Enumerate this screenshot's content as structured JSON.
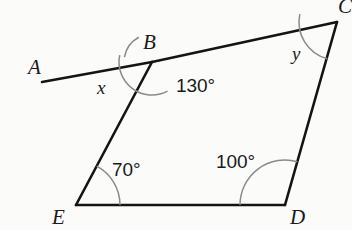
{
  "figure": {
    "background_color": "#fbfbfa",
    "stroke_color": "#141414",
    "arc_color": "#8a8a8a",
    "label_color": "#1a1a1a"
  },
  "vertices": [
    {
      "id": "A",
      "label": "A",
      "x": 42,
      "y": 82,
      "label_x": 28,
      "label_y": 57,
      "type": "ray-endpoint"
    },
    {
      "id": "B",
      "label": "B",
      "x": 152,
      "y": 62,
      "label_x": 143,
      "label_y": 32,
      "type": "vertex"
    },
    {
      "id": "C",
      "label": "C",
      "x": 337,
      "y": 22,
      "label_x": 338,
      "label_y": -4,
      "type": "vertex"
    },
    {
      "id": "D",
      "label": "D",
      "x": 285,
      "y": 205,
      "label_x": 290,
      "label_y": 207,
      "type": "vertex"
    },
    {
      "id": "E",
      "label": "E",
      "x": 76,
      "y": 205,
      "label_x": 52,
      "label_y": 207,
      "type": "vertex"
    }
  ],
  "segments": [
    {
      "name": "ray-A-to-B",
      "from": "A",
      "to": "B"
    },
    {
      "name": "segment-B-to-C",
      "from": "B",
      "to": "C"
    },
    {
      "name": "segment-C-to-D",
      "from": "C",
      "to": "D"
    },
    {
      "name": "segment-D-to-E",
      "from": "D",
      "to": "E"
    },
    {
      "name": "segment-E-to-B",
      "from": "E",
      "to": "B"
    }
  ],
  "angles": [
    {
      "id": "x",
      "at_vertex": "B",
      "label": "x",
      "label_kind": "variable",
      "known": false,
      "label_x": 97,
      "label_y": 78,
      "arc_radius": 28,
      "arc_start_deg": 190,
      "arc_end_deg": 242
    },
    {
      "id": "angle-B",
      "at_vertex": "B",
      "label": "130°",
      "label_kind": "measure",
      "known": true,
      "value": 130,
      "label_x": 176,
      "label_y": 76,
      "arc_radius": 33,
      "arc_start_deg": 62,
      "arc_end_deg": 192
    },
    {
      "id": "y",
      "at_vertex": "C",
      "label": "y",
      "label_kind": "variable",
      "known": false,
      "label_x": 292,
      "label_y": 44,
      "arc_radius": 38,
      "arc_start_deg": 105,
      "arc_end_deg": 192
    },
    {
      "id": "angle-D",
      "at_vertex": "D",
      "label": "100°",
      "label_kind": "measure",
      "known": true,
      "value": 100,
      "label_x": 216,
      "label_y": 152,
      "arc_radius": 45,
      "arc_start_deg": 180,
      "arc_end_deg": 286
    },
    {
      "id": "angle-E",
      "at_vertex": "E",
      "label": "70°",
      "label_kind": "measure",
      "known": true,
      "value": 70,
      "label_x": 112,
      "label_y": 160,
      "arc_radius": 44,
      "arc_start_deg": 298,
      "arc_end_deg": 360
    }
  ]
}
